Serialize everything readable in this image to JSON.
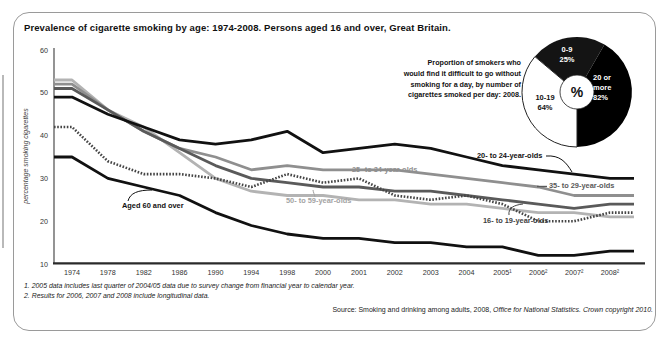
{
  "title": "Prevalence of cigarette smoking by age: 1974-2008. Persons aged 16 and over, Great Britain.",
  "chart_data": {
    "type": "line",
    "title": "Prevalence of cigarette smoking by age: 1974-2008",
    "xlabel": "",
    "ylabel": "percentage smoking cigarettes",
    "ylim": [
      10,
      60
    ],
    "yticks": [
      10,
      20,
      30,
      40,
      50,
      60
    ],
    "grid": false,
    "legend_position": "inline-labels",
    "categories": [
      "1974",
      "1978",
      "1982",
      "1986",
      "1990",
      "1994",
      "1998",
      "2000",
      "2001",
      "2002",
      "2003",
      "2004",
      "2005¹",
      "2006²",
      "2007²",
      "2008²"
    ],
    "series": [
      {
        "name": "16- to 19-year-olds",
        "color": "#454545",
        "label_color": "#3f3f3f",
        "width": 2.6,
        "dash": "1.6 1.6",
        "values": [
          42,
          34,
          31,
          31,
          30,
          28,
          31,
          29,
          30,
          26,
          25,
          26,
          24,
          20,
          20,
          22
        ]
      },
      {
        "name": "20- to 24-year-olds",
        "color": "#111111",
        "label_color": "#111111",
        "width": 2.8,
        "dash": "",
        "values": [
          49,
          45,
          42,
          39,
          38,
          39,
          41,
          36,
          37,
          38,
          37,
          35,
          33,
          32,
          31,
          30
        ]
      },
      {
        "name": "25- to 34-year-olds",
        "color": "#8f8f8f",
        "label_color": "#8f8f8f",
        "width": 2.8,
        "dash": "",
        "values": [
          52,
          46,
          41,
          37,
          35,
          32,
          33,
          32,
          32,
          32,
          31,
          30,
          29,
          28,
          26,
          26
        ]
      },
      {
        "name": "35- to 29-year-olds",
        "color": "#5a5a5a",
        "label_color": "#5a5a5a",
        "width": 2.8,
        "dash": "",
        "values": [
          51,
          46,
          41,
          37,
          33,
          30,
          29,
          28,
          28,
          27,
          27,
          26,
          25,
          24,
          23,
          24
        ]
      },
      {
        "name": "50- to 59-year-olds",
        "color": "#b3b3b3",
        "label_color": "#a3a3a3",
        "width": 2.8,
        "dash": "",
        "values": [
          53,
          46,
          42,
          36,
          30,
          27,
          26,
          26,
          25,
          25,
          24,
          24,
          23,
          22,
          22,
          21
        ]
      },
      {
        "name": "Aged 60 and over",
        "color": "#111111",
        "label_color": "#111111",
        "width": 2.8,
        "dash": "",
        "values": [
          35,
          30,
          28,
          26,
          22,
          19,
          17,
          16,
          16,
          15,
          15,
          14,
          14,
          12,
          12,
          13
        ]
      }
    ]
  },
  "pie": {
    "caption": "Proportion of smokers who\nwould find it difficult to go without\nsmoking for a day, by number of\ncigarettes smoked per day: 2008.",
    "center_label": "%",
    "slices": [
      {
        "name": "0-9",
        "label": "0-9\n25%",
        "pct": "25%",
        "start": 310,
        "end": 390,
        "color": "#141414",
        "text_color": "#ffffff"
      },
      {
        "name": "20 or more",
        "label": "20 or\nmore\n82%",
        "pct": "82%",
        "start": 30,
        "end": 180,
        "color": "#000000",
        "text_color": "#ffffff"
      },
      {
        "name": "10-19",
        "label": "10-19\n64%",
        "pct": "64%",
        "start": 180,
        "end": 310,
        "color": "#ffffff",
        "text_color": "#111111",
        "outline": "#222222"
      }
    ]
  },
  "footnotes": "1. 2005 data includes last quarter of 2004/05 data due to survey change from financial year to calendar year.\n2. Results for 2006, 2007 and 2008 include longitudinal data.",
  "source": {
    "prefix": "Source: Smoking and drinking among adults, 2008, ",
    "italic": "Office for National Statistics. Crown copyright 2010."
  }
}
